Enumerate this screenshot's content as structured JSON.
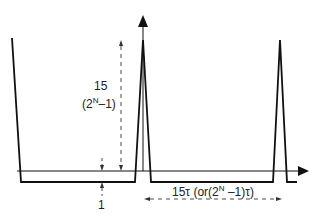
{
  "diagram": {
    "type": "pulse-timing-diagram",
    "labels": {
      "height_value": "15",
      "height_formula_prefix": "(2",
      "height_formula_sup": "N",
      "height_formula_suffix": "–1)",
      "low_level": "1",
      "period_prefix": "15τ (or(2",
      "period_sup": "N",
      "period_suffix": " –1)τ)"
    },
    "colors": {
      "line": "#111111",
      "dashed": "#333333",
      "background": "#ffffff"
    },
    "icons": {
      "y_axis_arrow": "arrow-up",
      "x_axis_arrow": "arrow-right"
    }
  }
}
